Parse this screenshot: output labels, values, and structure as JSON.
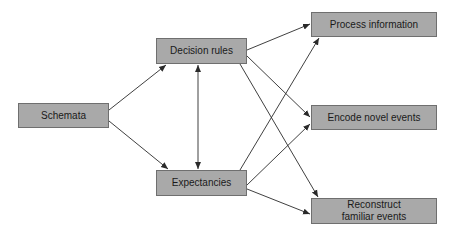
{
  "diagram": {
    "nodes": [
      {
        "id": "schemata",
        "label": "Schemata",
        "x": 18,
        "y": 103,
        "w": 91,
        "h": 25
      },
      {
        "id": "decision",
        "label": "Decision rules",
        "x": 156,
        "y": 38,
        "w": 91,
        "h": 26
      },
      {
        "id": "expect",
        "label": "Expectancies",
        "x": 156,
        "y": 170,
        "w": 91,
        "h": 26
      },
      {
        "id": "process",
        "label": "Process information",
        "x": 311,
        "y": 12,
        "w": 126,
        "h": 25
      },
      {
        "id": "encode",
        "label": "Encode novel events",
        "x": 311,
        "y": 105,
        "w": 126,
        "h": 25
      },
      {
        "id": "reconstruct",
        "label": "Reconstruct familiar events",
        "x": 311,
        "y": 198,
        "w": 126,
        "h": 26
      }
    ],
    "edges": [
      {
        "from": "schemata",
        "to": "decision"
      },
      {
        "from": "schemata",
        "to": "expect"
      },
      {
        "from": "decision",
        "to": "expect",
        "bidirectional": true
      },
      {
        "from": "decision",
        "to": "process"
      },
      {
        "from": "decision",
        "to": "encode"
      },
      {
        "from": "decision",
        "to": "reconstruct"
      },
      {
        "from": "expect",
        "to": "process"
      },
      {
        "from": "expect",
        "to": "encode"
      },
      {
        "from": "expect",
        "to": "reconstruct"
      }
    ],
    "colors": {
      "box_fill": "#a9a9a9",
      "box_border": "#6f6f6f",
      "line": "#2a2a2a"
    }
  }
}
